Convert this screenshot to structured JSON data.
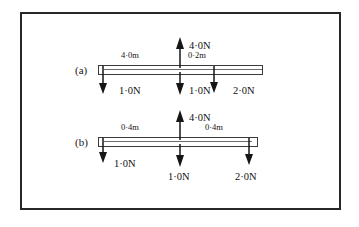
{
  "figure": {
    "border_color": "#272727",
    "background": "#ffffff",
    "ink_color": "#161616"
  },
  "diagrams": [
    {
      "panel_label": "(a)",
      "bar": {
        "left_dim_label": "4·0m",
        "right_dim_label": "0·2m"
      },
      "forces": [
        {
          "name": "left-downward-force",
          "label": "1·0N",
          "direction": "down",
          "magnitude": 1.0,
          "unit": "N"
        },
        {
          "name": "center-upward-force",
          "label": "4·0N",
          "direction": "up",
          "magnitude": 4.0,
          "unit": "N"
        },
        {
          "name": "center-downward-force",
          "label": "1·0N",
          "direction": "down",
          "magnitude": 1.0,
          "unit": "N"
        },
        {
          "name": "right-downward-force",
          "label": "2·0N",
          "direction": "down",
          "magnitude": 2.0,
          "unit": "N"
        }
      ]
    },
    {
      "panel_label": "(b)",
      "bar": {
        "left_dim_label": "0·4m",
        "right_dim_label": "0·4m"
      },
      "forces": [
        {
          "name": "left-downward-force",
          "label": "1·0N",
          "direction": "down",
          "magnitude": 1.0,
          "unit": "N"
        },
        {
          "name": "center-upward-force",
          "label": "4·0N",
          "direction": "up",
          "magnitude": 4.0,
          "unit": "N"
        },
        {
          "name": "center-downward-force",
          "label": "1·0N",
          "direction": "down",
          "magnitude": 1.0,
          "unit": "N"
        },
        {
          "name": "right-downward-force",
          "label": "2·0N",
          "direction": "down",
          "magnitude": 2.0,
          "unit": "N"
        }
      ]
    }
  ]
}
